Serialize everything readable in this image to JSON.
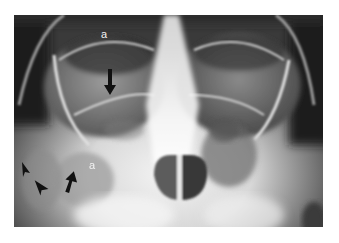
{
  "figure": {
    "type": "radiograph",
    "view": "occipitomental (Waters) view of paranasal sinuses",
    "labels": [
      {
        "id": "label-a-upper",
        "text": "a"
      },
      {
        "id": "label-a-lower",
        "text": "a"
      }
    ],
    "markers": [
      {
        "id": "arrow-upper",
        "type": "arrow",
        "direction": "down"
      },
      {
        "id": "arrow-lower",
        "type": "arrow",
        "direction": "up"
      },
      {
        "id": "arrowhead-1",
        "type": "arrowhead",
        "direction": "down-left"
      },
      {
        "id": "arrowhead-2",
        "type": "arrowhead",
        "direction": "up-left"
      }
    ]
  }
}
